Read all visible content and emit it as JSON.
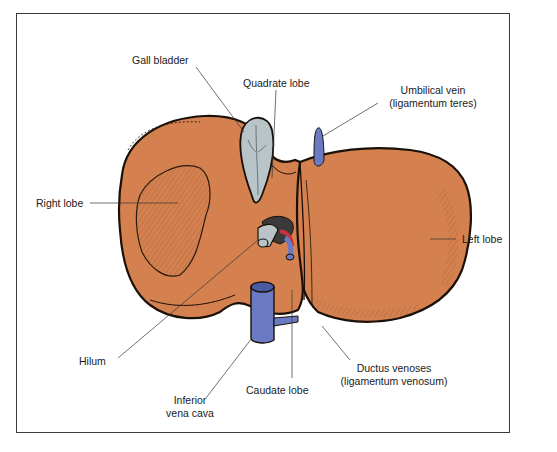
{
  "figure": {
    "colors": {
      "liver": "#d4804f",
      "liver_outline": "#1a1008",
      "gall_bladder": "#b8c4c8",
      "veins": "#6a7bc4",
      "artery": "#c8323a",
      "frame": "#3a3a3a"
    }
  },
  "labels": {
    "gall_bladder": "Gall bladder",
    "quadrate_lobe": "Quadrate lobe",
    "umbilical_vein_line1": "Umbilical vein",
    "umbilical_vein_line2": "(ligamentum teres)",
    "right_lobe": "Right lobe",
    "left_lobe": "Left lobe",
    "hilum": "Hilum",
    "inferior_vena_cava_line1": "Inferior",
    "inferior_vena_cava_line2": "vena cava",
    "caudate_lobe": "Caudate lobe",
    "ductus_venoses_line1": "Ductus venoses",
    "ductus_venoses_line2": "(ligamentum venosum)"
  }
}
